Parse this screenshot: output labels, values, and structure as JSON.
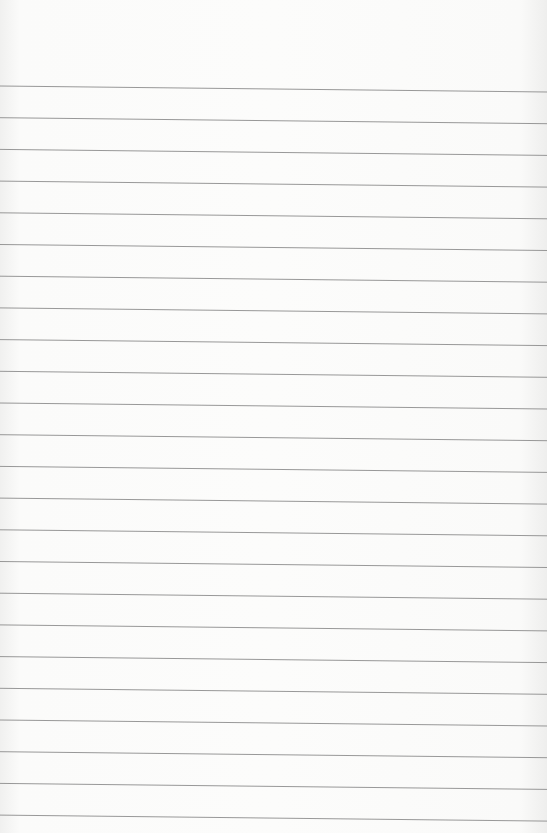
{
  "page": {
    "type": "lined-paper",
    "background_color": "#fbfbfa",
    "line_color": "#8c8c8c",
    "line_count": 24,
    "line_spacing_px": 31.7,
    "first_line_y": 86,
    "right_edge_drop_px": 6
  }
}
